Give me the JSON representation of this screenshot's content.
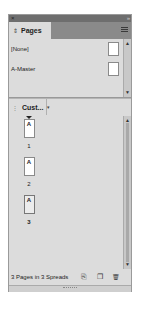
{
  "panel": {
    "title_bar": {
      "close_glyph": "×",
      "collapse_glyph": "»"
    },
    "tab": {
      "arrows_glyph": "⇕",
      "label": "Pages"
    },
    "menu_icon": "panel-menu-icon",
    "masters": [
      {
        "label": "[None]"
      },
      {
        "label": "A-Master"
      }
    ],
    "pages_view": {
      "tab_label": "Cust...",
      "grip_glyph": "⋮",
      "caret_glyph": "▾"
    },
    "pages": [
      {
        "master_prefix": "A",
        "number": "1",
        "selected": false
      },
      {
        "master_prefix": "A",
        "number": "2",
        "selected": false
      },
      {
        "master_prefix": "A",
        "number": "3",
        "selected": true
      }
    ],
    "scroll": {
      "up": "▲",
      "down": "▼"
    },
    "footer": {
      "status": "3 Pages in 3 Spreads",
      "edit_page_size_icon": "⎘",
      "new_page_icon": "❐",
      "delete_icon": "🗑"
    }
  },
  "colors": {
    "panel_bg": "#dcdcdc",
    "title_bar": "#6e6e6e",
    "tab_row": "#8a8a8a"
  }
}
